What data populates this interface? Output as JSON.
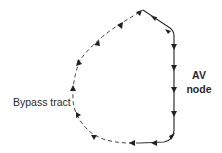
{
  "diagram": {
    "type": "reentry-circuit",
    "labels": {
      "av_node_line1": "AV",
      "av_node_line2": "node",
      "bypass_tract": "Bypass tract"
    },
    "colors": {
      "line": "#333333",
      "text": "#2a2a2a",
      "background": "#ffffff"
    },
    "segments": [
      {
        "name": "av-node-path",
        "style": "solid",
        "direction": "downward"
      },
      {
        "name": "ventricular-path",
        "style": "solid",
        "direction": "leftward"
      },
      {
        "name": "bypass-tract-path",
        "style": "dashed",
        "direction": "upward"
      },
      {
        "name": "atrial-path",
        "style": "solid",
        "direction": "rightward"
      }
    ]
  }
}
